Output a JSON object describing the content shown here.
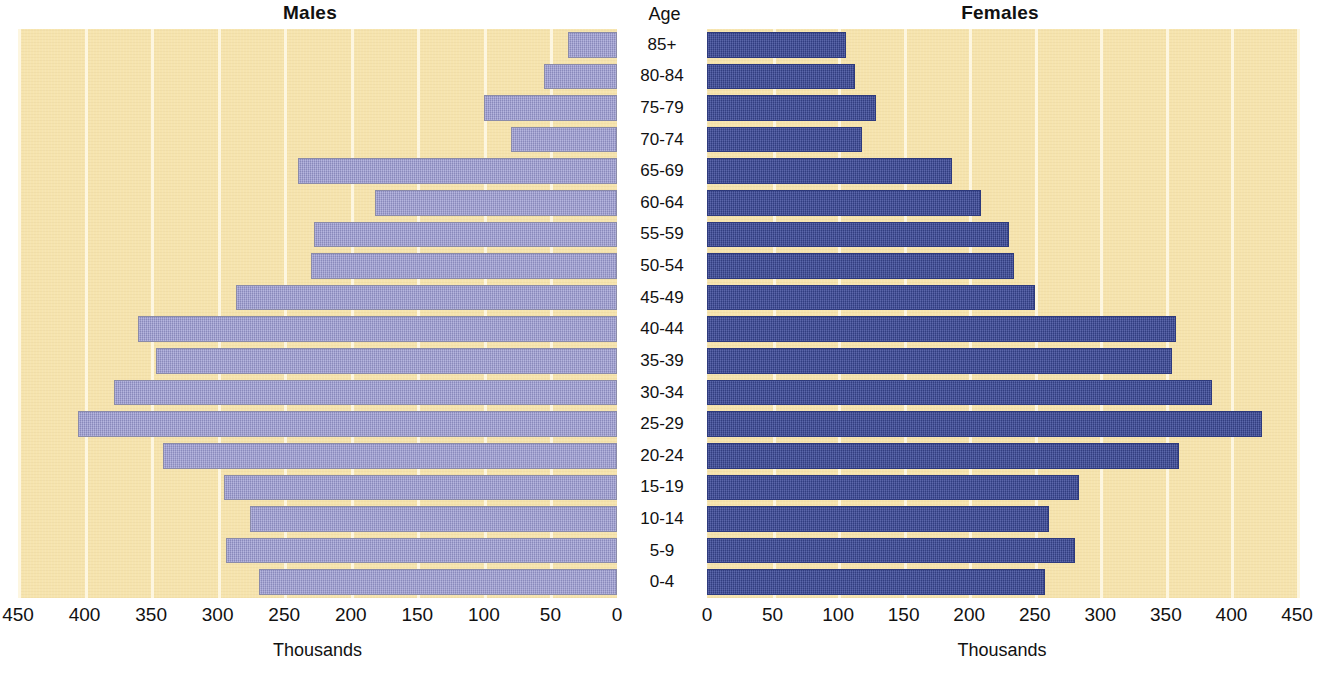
{
  "panels": {
    "males_title": "Males",
    "females_title": "Females",
    "age_header": "Age",
    "males_axis_caption": "Thousands",
    "females_axis_caption": "Thousands"
  },
  "colors": {
    "plot_background": "#f6e4ae",
    "gridline": "#fdf6e0",
    "male_bar": "#9a9ad2",
    "female_bar": "#3c4a9a",
    "text": "#111111"
  },
  "chart_data": {
    "type": "bar",
    "subtitle": "",
    "orientation": "horizontal",
    "layout": "population-pyramid",
    "xlabel": "Thousands",
    "ylabel": "Age",
    "grid": true,
    "legend_position": "none",
    "xlim_males": [
      450,
      0
    ],
    "xlim_females": [
      0,
      450
    ],
    "xticks_males": [
      450,
      400,
      350,
      300,
      250,
      200,
      150,
      100,
      50,
      0
    ],
    "xticks_females": [
      0,
      50,
      100,
      150,
      200,
      250,
      300,
      350,
      400,
      450
    ],
    "categories": [
      "85+",
      "80-84",
      "75-79",
      "70-74",
      "65-69",
      "60-64",
      "55-59",
      "50-54",
      "45-49",
      "40-44",
      "35-39",
      "30-34",
      "25-29",
      "20-24",
      "15-19",
      "10-14",
      "5-9",
      "0-4"
    ],
    "series": [
      {
        "name": "Males",
        "side": "left",
        "values": [
          37,
          55,
          100,
          80,
          240,
          182,
          228,
          230,
          286,
          360,
          346,
          378,
          405,
          341,
          295,
          276,
          294,
          269
        ]
      },
      {
        "name": "Females",
        "side": "right",
        "values": [
          106,
          113,
          129,
          118,
          187,
          209,
          230,
          234,
          250,
          358,
          355,
          385,
          423,
          360,
          284,
          261,
          281,
          258
        ]
      }
    ]
  }
}
